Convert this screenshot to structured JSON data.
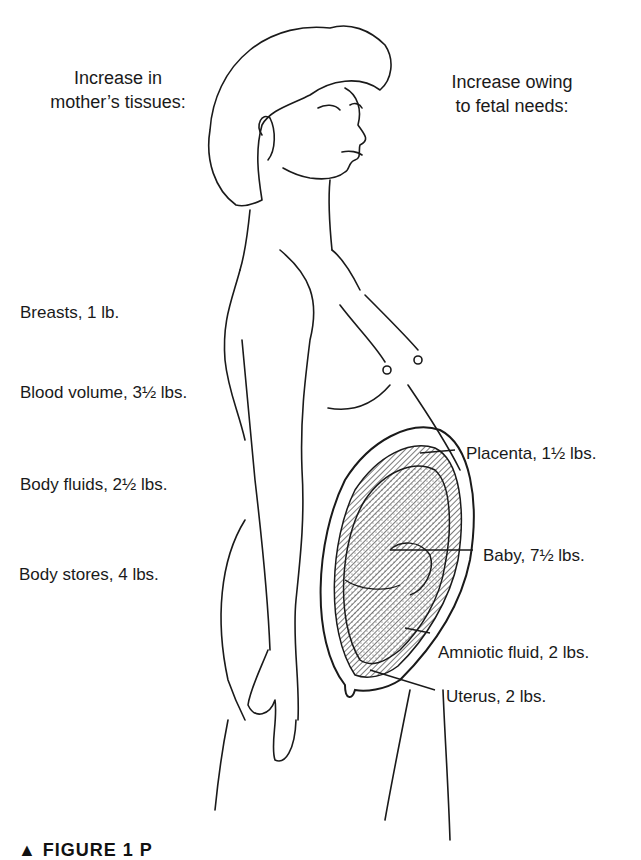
{
  "headers": {
    "left": [
      "Increase in",
      "mother’s tissues:"
    ],
    "right": [
      "Increase owing",
      "to fetal needs:"
    ]
  },
  "mother_tissues": [
    {
      "label": "Breasts, 1 lb."
    },
    {
      "label": "Blood volume, 3½ lbs."
    },
    {
      "label": "Body fluids, 2½ lbs."
    },
    {
      "label": "Body stores, 4 lbs."
    }
  ],
  "fetal_needs": [
    {
      "label": "Placenta, 1½ lbs."
    },
    {
      "label": "Baby, 7½ lbs."
    },
    {
      "label": "Amniotic fluid, 2 lbs."
    },
    {
      "label": "Uterus, 2 lbs."
    }
  ],
  "caption": "▲ FIGURE 1  P",
  "colors": {
    "ink": "#1a1a1a",
    "background": "#ffffff",
    "stipple": "#555555"
  }
}
